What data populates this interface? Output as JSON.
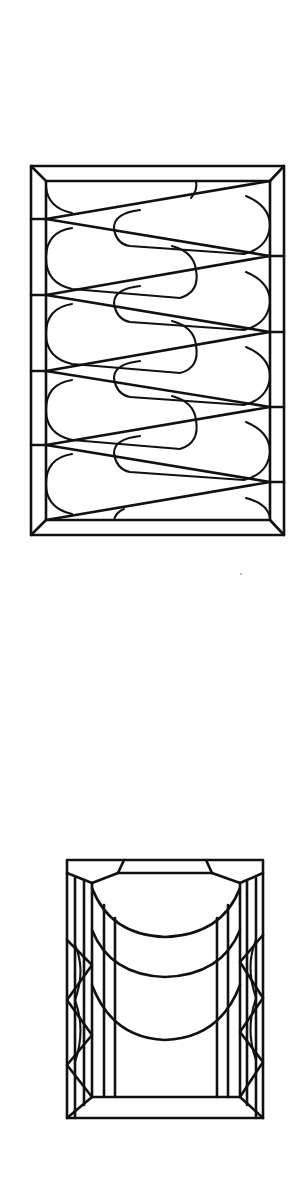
{
  "canvas": {
    "width": 303,
    "height": 1194,
    "background": "#ffffff",
    "stroke_color": "#111111"
  },
  "figures": [
    {
      "id": "panel-1",
      "description": "Rectangular window panel with bevelled frame and zig-zag diagonal bars enclosing alternating teardrop/loop shapes",
      "outer_frame": {
        "x1": 31,
        "y1": 166,
        "x2": 284,
        "y2": 535
      },
      "inner_frame": {
        "x1": 46,
        "y1": 181,
        "x2": 270,
        "y2": 520
      },
      "zigzag_vertices": [
        [
          46,
          208
        ],
        [
          270,
          255
        ],
        [
          46,
          298
        ],
        [
          270,
          330
        ],
        [
          46,
          372
        ],
        [
          270,
          404
        ],
        [
          46,
          444
        ],
        [
          270,
          478
        ],
        [
          46,
          518
        ]
      ],
      "loop_count_left": 5,
      "loop_count_right": 5
    },
    {
      "id": "panel-2",
      "description": "Rectangular window panel with bevelled frame, three nested arcs at top, vertical bars and diamond pattern on the sides",
      "outer_frame": {
        "x1": 67,
        "y1": 860,
        "x2": 263,
        "y2": 1118
      },
      "inner_frame": {
        "x1": 92,
        "y1": 873,
        "x2": 240,
        "y2": 1097
      },
      "arc_count": 3
    }
  ],
  "artifacts": [
    {
      "type": "speck",
      "x": 241,
      "y": 574
    }
  ]
}
